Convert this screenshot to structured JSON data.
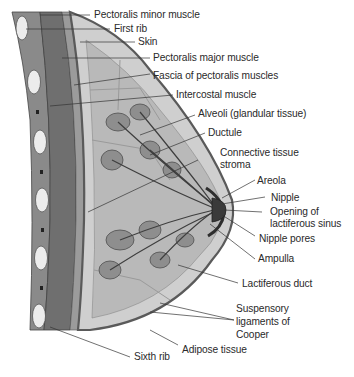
{
  "diagram": {
    "type": "anatomical-cross-section",
    "palette": {
      "background": "#ffffff",
      "label_text": "#2a2a2a",
      "leader_line": "#333333",
      "skin": "#6e6e6e",
      "muscle": "#7a7a7a",
      "adipose": "#c9c9c9",
      "gland": "#8c8c8c",
      "duct": "#4a4a4a",
      "rib": "#e6e6e6",
      "areola": "#3a3a3a"
    },
    "labels": {
      "pectoralis_minor": "Pectoralis minor muscle",
      "first_rib": "First rib",
      "skin": "Skin",
      "pectoralis_major": "Pectoralis major muscle",
      "fascia": "Fascia of pectoralis muscles",
      "intercostal": "Intercostal muscle",
      "alveoli": "Alveoli (glandular tissue)",
      "ductule": "Ductule",
      "connective_1": "Connective tissue",
      "connective_2": "stroma",
      "areola": "Areola",
      "nipple": "Nipple",
      "opening_1": "Opening of",
      "opening_2": "lactiferous sinus",
      "nipple_pores": "Nipple pores",
      "ampulla": "Ampulla",
      "lactiferous_duct": "Lactiferous duct",
      "suspensory_1": "Suspensory",
      "suspensory_2": "ligaments of",
      "suspensory_3": "Cooper",
      "adipose": "Adipose tissue",
      "sixth_rib": "Sixth rib"
    }
  }
}
